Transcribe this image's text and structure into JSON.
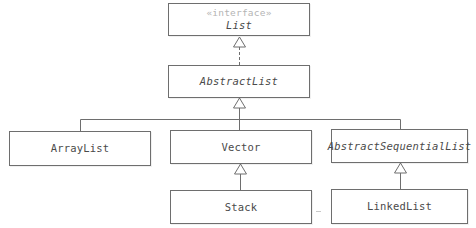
{
  "diagram": {
    "type": "UML class hierarchy",
    "nodes": [
      {
        "id": "list",
        "stereotype": "«interface»",
        "name": "List",
        "italic": true,
        "x": 168,
        "y": 3,
        "w": 142,
        "h": 33
      },
      {
        "id": "abstractlist",
        "name": "AbstractList",
        "italic": true,
        "x": 168,
        "y": 65,
        "w": 142,
        "h": 33
      },
      {
        "id": "arraylist",
        "name": "ArrayList",
        "italic": false,
        "x": 9,
        "y": 131,
        "w": 142,
        "h": 35
      },
      {
        "id": "vector",
        "name": "Vector",
        "italic": false,
        "x": 170,
        "y": 130,
        "w": 142,
        "h": 34
      },
      {
        "id": "abstractsequentiallist",
        "name": "AbstractSequentialList",
        "italic": true,
        "x": 331,
        "y": 129,
        "w": 137,
        "h": 34
      },
      {
        "id": "stack",
        "name": "Stack",
        "italic": false,
        "x": 170,
        "y": 190,
        "w": 142,
        "h": 34
      },
      {
        "id": "linkedlist",
        "name": "LinkedList",
        "italic": false,
        "x": 331,
        "y": 189,
        "w": 137,
        "h": 35
      }
    ],
    "edges": [
      {
        "from": "abstractlist",
        "to": "list",
        "kind": "realization",
        "style": "dashed"
      },
      {
        "from": "arraylist",
        "to": "abstractlist",
        "kind": "generalization",
        "style": "solid"
      },
      {
        "from": "vector",
        "to": "abstractlist",
        "kind": "generalization",
        "style": "solid"
      },
      {
        "from": "abstractsequentiallist",
        "to": "abstractlist",
        "kind": "generalization",
        "style": "solid"
      },
      {
        "from": "stack",
        "to": "vector",
        "kind": "generalization",
        "style": "solid"
      },
      {
        "from": "linkedlist",
        "to": "abstractsequentiallist",
        "kind": "generalization",
        "style": "solid"
      }
    ],
    "colors": {
      "line": "#6e6e6e",
      "text": "#4a4a4a",
      "stereotype": "#b4b4b4",
      "background": "#ffffff"
    }
  },
  "labels": {
    "list_stereotype": "«interface»",
    "list": "List",
    "abstractlist": "AbstractList",
    "arraylist": "ArrayList",
    "vector": "Vector",
    "abstractsequentiallist": "AbstractSequentialList",
    "stack": "Stack",
    "linkedlist": "LinkedList"
  }
}
